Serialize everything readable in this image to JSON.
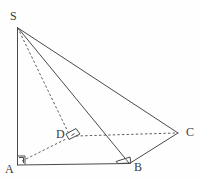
{
  "figure": {
    "background_color": "#fefefe",
    "stroke_color": "#4a4a4a",
    "label_color": "#3c3c3c",
    "width": 202,
    "height": 179
  },
  "vertices": {
    "S": {
      "label": "S",
      "x": 17,
      "y": 27,
      "label_x": 10,
      "label_y": 10
    },
    "A": {
      "label": "A",
      "x": 17,
      "y": 165,
      "label_x": 5,
      "label_y": 163
    },
    "B": {
      "label": "B",
      "x": 129,
      "y": 163,
      "label_x": 134,
      "label_y": 161
    },
    "C": {
      "label": "C",
      "x": 178,
      "y": 133,
      "label_x": 186,
      "label_y": 126
    },
    "D": {
      "label": "D",
      "x": 70,
      "y": 137,
      "label_x": 56,
      "label_y": 128
    }
  },
  "edges": [
    {
      "name": "SA",
      "from": "S",
      "to": "A",
      "style": "solid"
    },
    {
      "name": "SB",
      "from": "S",
      "to": "B",
      "style": "solid"
    },
    {
      "name": "SC",
      "from": "S",
      "to": "C",
      "style": "solid"
    },
    {
      "name": "SD",
      "from": "S",
      "to": "D",
      "style": "dashed"
    },
    {
      "name": "AB",
      "from": "A",
      "to": "B",
      "style": "solid"
    },
    {
      "name": "AD",
      "from": "A",
      "to": "D",
      "style": "dashed"
    },
    {
      "name": "BC",
      "from": "B",
      "to": "C",
      "style": "solid"
    },
    {
      "name": "DC",
      "from": "D",
      "to": "C",
      "style": "dashed"
    }
  ],
  "angle_marks": [
    {
      "name": "right-angle-at-A",
      "at": "A",
      "type": "square"
    },
    {
      "name": "right-angle-at-D",
      "at": "D",
      "type": "skewed-square"
    },
    {
      "name": "angle-at-B",
      "at": "B",
      "type": "skewed-square"
    }
  ]
}
